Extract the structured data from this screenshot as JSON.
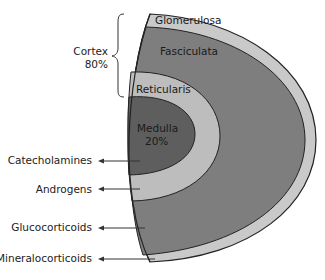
{
  "diagram": {
    "cortex_label": "Cortex",
    "cortex_percent": "80%",
    "medulla_percent": "20%",
    "zones": [
      {
        "name": "Glomerulosa",
        "color": "#c9c9c9"
      },
      {
        "name": "Fasciculata",
        "color": "#7e7e7e"
      },
      {
        "name": "Reticularis",
        "color": "#bdbdbd"
      },
      {
        "name": "Medulla",
        "color": "#5e5e5e"
      }
    ],
    "products": [
      {
        "label": "Catecholamines",
        "zone": "Medulla"
      },
      {
        "label": "Androgens",
        "zone": "Reticularis"
      },
      {
        "label": "Glucocorticoids",
        "zone": "Fasciculata"
      },
      {
        "label": "Mineralocorticoids",
        "zone": "Glomerulosa"
      }
    ],
    "outline_color": "#222222"
  }
}
